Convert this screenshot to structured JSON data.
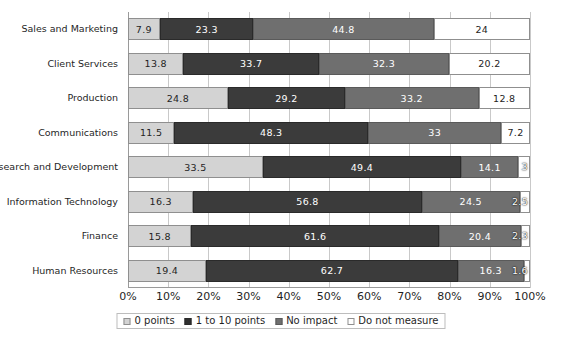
{
  "chart_data": {
    "type": "bar",
    "orientation": "horizontal",
    "stacked": true,
    "stack_mode": "percent",
    "title": "",
    "subtitle": "",
    "xlabel": "",
    "ylabel": "",
    "xlim": [
      0,
      100
    ],
    "grid": true,
    "legend_position": "bottom",
    "xticks": [
      "0%",
      "10%",
      "20%",
      "30%",
      "40%",
      "50%",
      "60%",
      "70%",
      "80%",
      "90%",
      "100%"
    ],
    "xtick_values": [
      0,
      10,
      20,
      30,
      40,
      50,
      60,
      70,
      80,
      90,
      100
    ],
    "categories": [
      "Sales and Marketing",
      "Client Services",
      "Production",
      "Communications",
      "Research and Development",
      "Information Technology",
      "Finance",
      "Human Resources"
    ],
    "series": [
      {
        "name": "0 points",
        "color": "#d3d3d3",
        "values": [
          7.9,
          13.8,
          24.8,
          11.5,
          33.5,
          16.3,
          15.8,
          19.4
        ]
      },
      {
        "name": "1 to 10 points",
        "color": "#3b3b3b",
        "values": [
          23.3,
          33.7,
          29.2,
          48.3,
          49.4,
          56.8,
          61.6,
          62.7
        ]
      },
      {
        "name": "No impact",
        "color": "#6f6f6f",
        "values": [
          44.8,
          32.3,
          33.2,
          33.0,
          14.1,
          24.5,
          20.4,
          16.3
        ]
      },
      {
        "name": "Do not measure",
        "color": "#ffffff",
        "values": [
          24.0,
          20.2,
          12.8,
          7.2,
          3.0,
          2.5,
          2.3,
          1.6
        ]
      }
    ],
    "data_labels": [
      [
        "7.9",
        "23.3",
        "44.8",
        "24"
      ],
      [
        "13.8",
        "33.7",
        "32.3",
        "20.2"
      ],
      [
        "24.8",
        "29.2",
        "33.2",
        "12.8"
      ],
      [
        "11.5",
        "48.3",
        "33",
        "7.2"
      ],
      [
        "33.5",
        "49.4",
        "14.1",
        "3"
      ],
      [
        "16.3",
        "56.8",
        "24.5",
        "2.5"
      ],
      [
        "15.8",
        "61.6",
        "20.4",
        "2.3"
      ],
      [
        "19.4",
        "62.7",
        "16.3",
        "1.6"
      ]
    ]
  }
}
